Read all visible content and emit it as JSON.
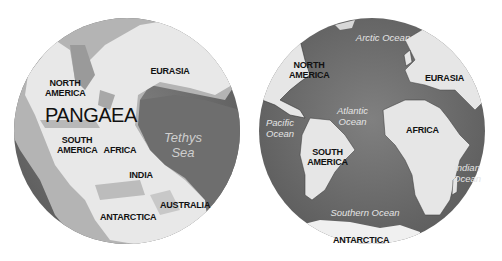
{
  "figure": {
    "left_globe": {
      "title": "PANGAEA",
      "labels": {
        "north_america": "NORTH\nAMERICA",
        "eurasia": "EURASIA",
        "south_america": "SOUTH\nAMERICA",
        "africa": "AFRICA",
        "india": "INDIA",
        "antarctica": "ANTARCTICA",
        "australia": "AUSTRALIA"
      },
      "sea": "Tethys\nSea"
    },
    "right_globe": {
      "labels": {
        "north_america": "NORTH\nAMERICA",
        "eurasia": "EURASIA",
        "south_america": "SOUTH\nAMERICA",
        "africa": "AFRICA",
        "antarctica": "ANTARCTICA"
      },
      "oceans": {
        "arctic": "Arctic Ocean",
        "atlantic": "Atlantic\nOcean",
        "pacific": "Pacific\nOcean",
        "indian": "Indian\nOcean",
        "southern": "Southern Ocean"
      }
    },
    "colors": {
      "ocean": "#6e6e6e",
      "land": "#e6e6e6",
      "shelf": "#b4b4b4",
      "label": "#111111",
      "ocean_label": "#e4e4e4"
    }
  }
}
